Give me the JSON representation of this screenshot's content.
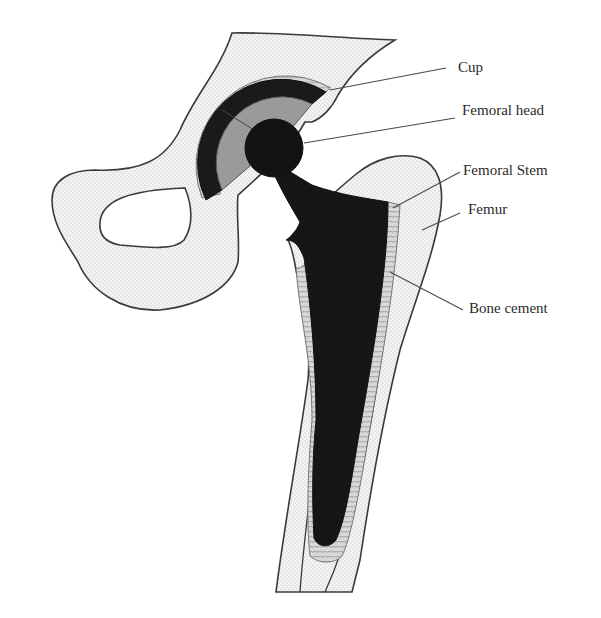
{
  "diagram": {
    "colors": {
      "bone_fill": "#f2f2f2",
      "bone_dots": "#b8b8b8",
      "outline": "#3a3a3a",
      "implant": "#141414",
      "cup_liner": "#9a9a9a",
      "cement": "#c8c8c8",
      "leader": "#4a4a4a"
    },
    "labels": [
      {
        "id": "cup",
        "text": "Cup"
      },
      {
        "id": "femoral-head",
        "text": "Femoral head"
      },
      {
        "id": "femoral-stem",
        "text": "Femoral Stem"
      },
      {
        "id": "femur",
        "text": "Femur"
      },
      {
        "id": "bone-cement",
        "text": "Bone cement"
      }
    ]
  }
}
